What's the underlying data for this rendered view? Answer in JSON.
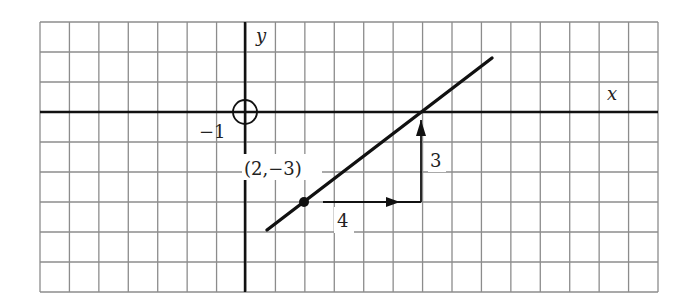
{
  "chart_data": {
    "type": "line",
    "title": "",
    "xlabel": "x",
    "ylabel": "y",
    "grid": true,
    "xlim": [
      -7,
      14
    ],
    "ylim": [
      -6,
      3
    ],
    "origin_marker": "circle",
    "tick_labels": [
      {
        "text": "−1",
        "position": "near origin, lower left"
      }
    ],
    "series": [
      {
        "name": "line",
        "equation": "y = 3/4 x - 9/2",
        "slope": 0.75,
        "x": [
          0.75,
          8.4
        ],
        "y": [
          -3.94,
          1.8
        ]
      }
    ],
    "points": [
      {
        "label": "(2,−3)",
        "x": 2,
        "y": -3
      }
    ],
    "annotations": [
      {
        "type": "run-arrow",
        "from": [
          2,
          -3
        ],
        "to": [
          6,
          -3
        ],
        "label": "4"
      },
      {
        "type": "rise-arrow",
        "from": [
          6,
          -3
        ],
        "to": [
          6,
          0
        ],
        "label": "3"
      }
    ]
  },
  "labels": {
    "x_axis": "x",
    "y_axis": "y",
    "minus_one": "−1",
    "point": "(2,−3)",
    "run": "4",
    "rise": "3"
  },
  "colors": {
    "grid": "#8c8c8c",
    "axis": "#111111",
    "line": "#111111",
    "background": "#ffffff"
  }
}
